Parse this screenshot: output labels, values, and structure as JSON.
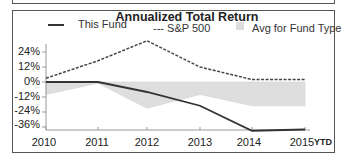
{
  "chart_data": {
    "type": "line",
    "title": "Annualized Total Return",
    "xlabel": "",
    "ylabel": "",
    "categories": [
      "2010",
      "2011",
      "2012",
      "2013",
      "2014",
      "2015"
    ],
    "x_suffix": "YTD",
    "yticks": [
      "24%",
      "12%",
      "0%",
      "-12%",
      "-24%",
      "-36%"
    ],
    "ylim": [
      -38,
      30
    ],
    "grid": false,
    "legend_position": "top",
    "series": [
      {
        "name": "This Fund",
        "style": "solid",
        "color": "#333333",
        "values": [
          0,
          0,
          -8,
          -19,
          -39,
          -38
        ]
      },
      {
        "name": "S&P 500",
        "style": "dashed",
        "color": "#444444",
        "values": [
          3,
          17,
          33,
          12,
          2,
          2
        ]
      },
      {
        "name": "Avg for Fund Type",
        "style": "area",
        "color": "#dddddd",
        "values": [
          -10,
          -1,
          -21,
          -10,
          -19,
          -19
        ]
      }
    ]
  },
  "legend": {
    "fund": "This Fund",
    "sp": "--- S&P 500",
    "avg": "Avg for Fund Type"
  }
}
